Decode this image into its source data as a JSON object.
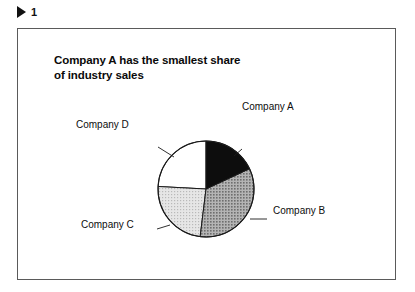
{
  "header": {
    "marker_icon": "play-triangle-icon",
    "number": "1"
  },
  "figure": {
    "title_line_1": "Company A has the smallest share",
    "title_line_2": "of industry sales"
  },
  "chart_data": {
    "type": "pie",
    "title": "Company A has the smallest share of industry sales",
    "subtitle": "",
    "xlabel": "",
    "ylabel": "",
    "legend_position": "none",
    "labels_position": "outside-callout",
    "grid": false,
    "start_angle_deg": 0,
    "direction": "clockwise",
    "categories": [
      "Company A",
      "Company B",
      "Company C",
      "Company D"
    ],
    "values": [
      18,
      34,
      24,
      24
    ],
    "units": "percent share of industry sales",
    "slices": [
      {
        "label": "Company A",
        "value": 18,
        "fill": "#0d0d0d",
        "pattern": "solid",
        "start_angle_deg": 0,
        "end_angle_deg": 65
      },
      {
        "label": "Company B",
        "value": 34,
        "fill": "#9c9c9c",
        "pattern": "fine-dot-screen",
        "start_angle_deg": 65,
        "end_angle_deg": 187
      },
      {
        "label": "Company C",
        "value": 24,
        "fill": "#d6d6d6",
        "pattern": "light-dot-screen",
        "start_angle_deg": 187,
        "end_angle_deg": 273
      },
      {
        "label": "Company D",
        "value": 24,
        "fill": "#ffffff",
        "pattern": "none",
        "start_angle_deg": 273,
        "end_angle_deg": 360
      }
    ]
  },
  "colors": {
    "frame_border": "#5a5a5a",
    "pie_outline": "#1a1a1a",
    "text": "#0d0d0d",
    "background": "#ffffff"
  }
}
